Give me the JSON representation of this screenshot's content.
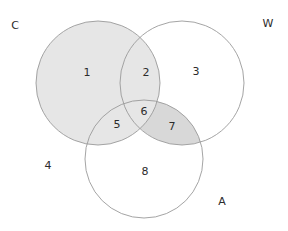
{
  "diagram": {
    "type": "venn-3-set",
    "width": 288,
    "height": 231,
    "background_color": "#ffffff",
    "outline_color": "#9a9a9a",
    "outline_width": 0.9,
    "shade_color_light": "#e6e6e6",
    "shade_color_medium": "#d8d8d8",
    "text_color": "#2b2b2b",
    "sets": [
      {
        "key": "C",
        "label": "C",
        "label_x": 15,
        "label_y": 26,
        "cx": 98,
        "cy": 83,
        "r": 62,
        "shaded": true
      },
      {
        "key": "W",
        "label": "W",
        "label_x": 268,
        "label_y": 24,
        "cx": 182,
        "cy": 83,
        "r": 62,
        "shaded": false
      },
      {
        "key": "A",
        "label": "A",
        "label_x": 222,
        "label_y": 202,
        "cx": 144,
        "cy": 159,
        "r": 59,
        "shaded": false
      }
    ],
    "regions": [
      {
        "id": "r1",
        "label": "1",
        "membership": "C only",
        "x": 87,
        "y": 73,
        "shaded": "light"
      },
      {
        "id": "r2",
        "label": "2",
        "membership": "C and W",
        "x": 146,
        "y": 73,
        "shaded": "light"
      },
      {
        "id": "r3",
        "label": "3",
        "membership": "W only",
        "x": 196,
        "y": 72,
        "shaded": "none"
      },
      {
        "id": "r4",
        "label": "4",
        "membership": "outside all",
        "x": 48,
        "y": 166,
        "shaded": "none"
      },
      {
        "id": "r5",
        "label": "5",
        "membership": "C and A",
        "x": 117,
        "y": 125,
        "shaded": "light"
      },
      {
        "id": "r6",
        "label": "6",
        "membership": "C and W and A",
        "x": 144,
        "y": 112,
        "shaded": "light"
      },
      {
        "id": "r7",
        "label": "7",
        "membership": "W and A",
        "x": 172,
        "y": 127,
        "shaded": "medium"
      },
      {
        "id": "r8",
        "label": "8",
        "membership": "A only",
        "x": 145,
        "y": 172,
        "shaded": "none"
      }
    ]
  }
}
